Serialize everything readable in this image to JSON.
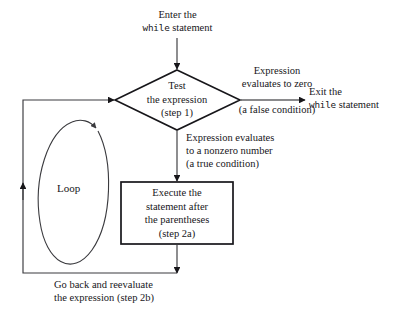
{
  "diagram": {
    "background_color": "#ffffff",
    "stroke_color": "#17161a",
    "thin_stroke_color": "#3a3a3e"
  },
  "entry": {
    "line1": "Enter the",
    "line2_mono": "while",
    "line2_rest": " statement"
  },
  "decision": {
    "line1": "Test",
    "line2": "the expression",
    "line3": "(step 1)"
  },
  "false_branch": {
    "line1": "Expression",
    "line2": "evaluates to zero",
    "line3": "(a false condition)"
  },
  "exit": {
    "line1": "Exit the",
    "line2_mono": "while",
    "line2_rest": " statement"
  },
  "true_branch": {
    "line1": "Expression evaluates",
    "line2": "to a nonzero number",
    "line3": "(a true condition)"
  },
  "process": {
    "line1": "Execute the",
    "line2": "statement after",
    "line3": "the parentheses",
    "line4": "(step 2a)"
  },
  "loop": {
    "label": "Loop"
  },
  "feedback": {
    "line1": "Go back and reevaluate",
    "line2": "the expression (step 2b)"
  }
}
